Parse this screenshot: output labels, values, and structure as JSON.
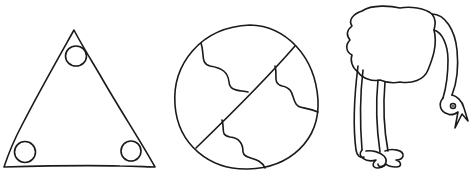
{
  "canvas": {
    "width": 473,
    "height": 177,
    "background": "#ffffff",
    "ink": "#1a1a1a"
  },
  "figures": [
    {
      "id": "triangle",
      "label": "triangle with three circles in corners"
    },
    {
      "id": "divided-circle",
      "label": "circle split by diagonal line with wavy lines"
    },
    {
      "id": "ostrich",
      "label": "ostrich with head bent down"
    }
  ]
}
